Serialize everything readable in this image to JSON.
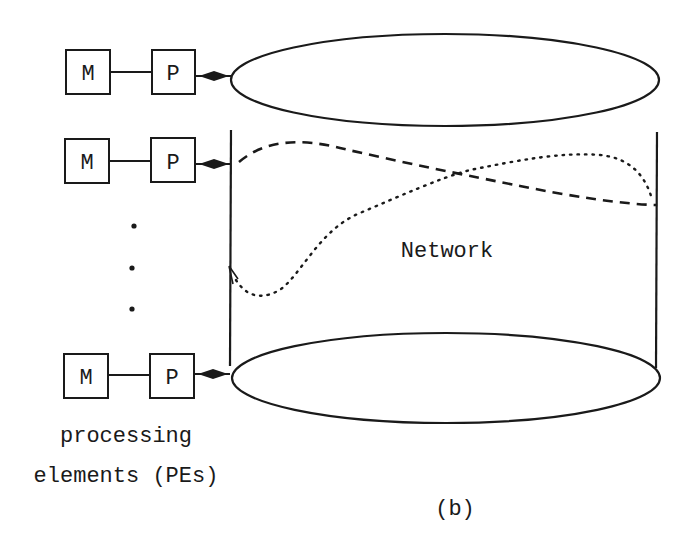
{
  "figure": {
    "label": "(b)",
    "network_label": "Network",
    "caption_line1": "processing",
    "caption_line2": "elements (PEs)"
  },
  "processing_elements": [
    {
      "memory_label": "M",
      "processor_label": "P"
    },
    {
      "memory_label": "M",
      "processor_label": "P"
    },
    {
      "memory_label": "M",
      "processor_label": "P"
    }
  ],
  "ellipsis": "⋮",
  "paths": [
    {
      "name": "dashed-path",
      "style": "dashed"
    },
    {
      "name": "dotted-path",
      "style": "dotted"
    }
  ],
  "colors": {
    "stroke": "#1a1a1a",
    "background": "#ffffff"
  }
}
